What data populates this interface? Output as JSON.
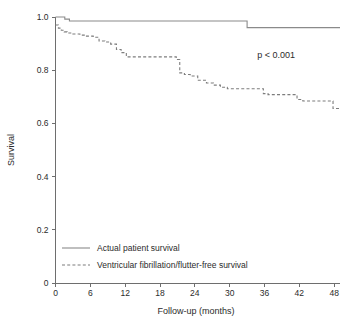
{
  "chart_data": {
    "type": "line",
    "title": "",
    "subtitle": "",
    "xlabel": "Follow-up (months)",
    "ylabel": "Survival",
    "xlim": [
      0,
      49
    ],
    "ylim": [
      0,
      1.0
    ],
    "grid": false,
    "legend_position": "bottom-left",
    "xticks": [
      "0",
      "6",
      "12",
      "18",
      "24",
      "30",
      "36",
      "42",
      "48"
    ],
    "xtick_values": [
      0,
      6,
      12,
      18,
      24,
      30,
      36,
      42,
      48
    ],
    "yticks": [
      "0",
      "0.2",
      "0.4",
      "0.6",
      "0.8",
      "1.0"
    ],
    "ytick_values": [
      0,
      0.2,
      0.4,
      0.6,
      0.8,
      1.0
    ],
    "annotations": [
      {
        "name": "p-value",
        "text": "p < 0.001",
        "x": 38,
        "y": 0.845
      }
    ],
    "series": [
      {
        "name": "Actual patient survival",
        "style": "solid",
        "color": "#8a8a8a",
        "curve": "step",
        "x": [
          0,
          1.6,
          1.6,
          2.4,
          2.4,
          33.0,
          33.0,
          49.0
        ],
        "y": [
          1.0,
          1.0,
          0.992,
          0.992,
          0.985,
          0.985,
          0.96,
          0.96
        ]
      },
      {
        "name": "Ventricular fibrillation/flutter-free survival",
        "style": "dashed",
        "color": "#7d7d7d",
        "curve": "step",
        "x": [
          0.0,
          0.5,
          0.5,
          1.0,
          1.0,
          1.5,
          1.5,
          2.0,
          2.0,
          3.0,
          3.0,
          4.2,
          4.2,
          5.2,
          5.2,
          6.5,
          6.5,
          7.5,
          7.5,
          8.5,
          8.5,
          9.5,
          9.5,
          10.5,
          10.5,
          11.3,
          11.3,
          12.2,
          12.2,
          20.8,
          20.8,
          21.4,
          21.4,
          22.2,
          22.2,
          23.2,
          23.2,
          24.5,
          24.5,
          26.0,
          26.0,
          27.2,
          27.2,
          28.4,
          28.4,
          29.6,
          29.6,
          35.8,
          35.8,
          36.6,
          36.6,
          41.6,
          41.6,
          42.6,
          42.6,
          47.8,
          47.8,
          49.0
        ],
        "y": [
          0.97,
          0.97,
          0.958,
          0.958,
          0.95,
          0.95,
          0.944,
          0.944,
          0.94,
          0.94,
          0.936,
          0.936,
          0.932,
          0.932,
          0.928,
          0.928,
          0.924,
          0.924,
          0.91,
          0.91,
          0.906,
          0.906,
          0.898,
          0.898,
          0.878,
          0.878,
          0.866,
          0.866,
          0.85,
          0.85,
          0.84,
          0.84,
          0.79,
          0.79,
          0.784,
          0.784,
          0.778,
          0.778,
          0.762,
          0.762,
          0.752,
          0.752,
          0.744,
          0.744,
          0.736,
          0.736,
          0.73,
          0.73,
          0.712,
          0.712,
          0.708,
          0.708,
          0.69,
          0.69,
          0.684,
          0.684,
          0.656,
          0.656
        ]
      }
    ],
    "legend": [
      {
        "label": "Actual patient survival",
        "style": "solid"
      },
      {
        "label": "Ventricular fibrillation/flutter-free survival",
        "style": "dashed"
      }
    ]
  }
}
